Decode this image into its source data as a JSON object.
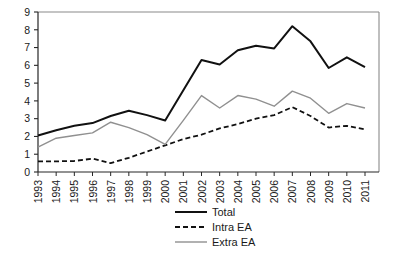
{
  "chart_data": {
    "type": "line",
    "title": "",
    "subtitle": "",
    "xlabel": "",
    "ylabel": "",
    "xlim": [
      1993,
      2011
    ],
    "ylim": [
      0,
      9
    ],
    "ytick_step": 1,
    "grid": false,
    "legend_position": "bottom-center",
    "frame": "box",
    "x": [
      1993,
      1994,
      1995,
      1996,
      1997,
      1998,
      1999,
      2000,
      2001,
      2002,
      2003,
      2004,
      2005,
      2006,
      2007,
      2008,
      2009,
      2010,
      2011
    ],
    "xtick_labels": [
      "1993",
      "1994",
      "1995",
      "1996",
      "1997",
      "1998",
      "1999",
      "2000",
      "2001",
      "2002",
      "2003",
      "2004",
      "2005",
      "2006",
      "2007",
      "2008",
      "2009",
      "2010",
      "2011"
    ],
    "ytick_labels": [
      "0",
      "1",
      "2",
      "3",
      "4",
      "5",
      "6",
      "7",
      "8",
      "9"
    ],
    "ytick_values": [
      0,
      1,
      2,
      3,
      4,
      5,
      6,
      7,
      8,
      9
    ],
    "series": [
      {
        "name": "Total",
        "style": "solid",
        "color": "#111111",
        "width": 2.0,
        "values": [
          2.05,
          2.35,
          2.6,
          2.75,
          3.15,
          3.45,
          3.2,
          2.9,
          4.6,
          6.3,
          6.05,
          6.85,
          7.1,
          6.95,
          8.2,
          7.35,
          5.85,
          6.45,
          5.9
        ]
      },
      {
        "name": "Intra EA",
        "style": "dashed",
        "color": "#111111",
        "width": 1.8,
        "values": [
          0.6,
          0.6,
          0.62,
          0.75,
          0.5,
          0.8,
          1.15,
          1.5,
          1.85,
          2.1,
          2.45,
          2.7,
          3.0,
          3.2,
          3.65,
          3.15,
          2.5,
          2.6,
          2.4
        ]
      },
      {
        "name": "Extra EA",
        "style": "solid",
        "color": "#909090",
        "width": 1.4,
        "values": [
          1.4,
          1.9,
          2.05,
          2.2,
          2.8,
          2.5,
          2.1,
          1.55,
          2.9,
          4.3,
          3.6,
          4.3,
          4.1,
          3.7,
          4.55,
          4.15,
          3.3,
          3.85,
          3.6
        ]
      }
    ]
  },
  "legend": {
    "items": [
      {
        "label": "Total",
        "key": "total"
      },
      {
        "label": "Intra EA",
        "key": "intra-ea"
      },
      {
        "label": "Extra EA",
        "key": "extra-ea"
      }
    ]
  },
  "axes": {
    "y_max_label": "9",
    "y_min_label": "0"
  }
}
